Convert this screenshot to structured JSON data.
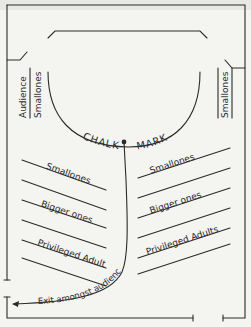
{
  "diagram": {
    "chalk_mark": {
      "left": "CHALK",
      "right": "MARK"
    },
    "side_labels": {
      "left_outer": "Audience",
      "left_inner": "Smallones",
      "right": "Smallones"
    },
    "rows_left": [
      {
        "label": "Smallones"
      },
      {
        "label": "Bigger ones"
      },
      {
        "label": "Privileged Adults"
      }
    ],
    "rows_right": [
      {
        "label": "Smallones"
      },
      {
        "label": "Bigger ones"
      },
      {
        "label": "Privileged Adults"
      }
    ],
    "exit_label": "Exit amongst audience",
    "colors": {
      "ink": "#2a2a2a",
      "paper": "#f4f4f1"
    }
  }
}
